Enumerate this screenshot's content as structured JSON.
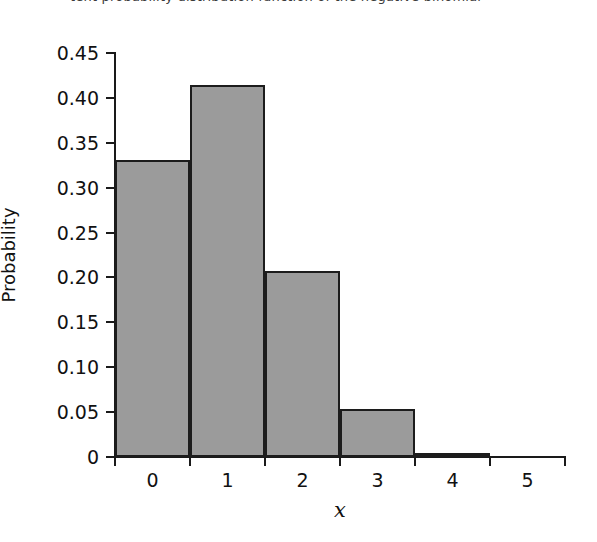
{
  "caption": {
    "text": "tent probability distribution function of the negative binomial"
  },
  "chart_data": {
    "type": "bar",
    "title": "",
    "subtitle": "",
    "xlabel": "x",
    "ylabel": "Probability",
    "categories": [
      "0",
      "1",
      "2",
      "3",
      "4",
      "5"
    ],
    "values": [
      0.331,
      0.414,
      0.207,
      0.053,
      0.005,
      0.0
    ],
    "ylim": [
      0,
      0.45
    ],
    "xlim": [
      0,
      6
    ],
    "ytick_labels": [
      "0.45",
      "0.40",
      "0.35",
      "0.30",
      "0.25",
      "0.20",
      "0.15",
      "0.10",
      "0.05",
      "0"
    ],
    "ytick_values": [
      0.45,
      0.4,
      0.35,
      0.3,
      0.25,
      0.2,
      0.15,
      0.1,
      0.05,
      0
    ],
    "xtick_labels": [
      "0",
      "1",
      "2",
      "3",
      "4",
      "5"
    ],
    "grid": false,
    "legend": null,
    "bar_fill_color": "#9b9b9b",
    "bar_edge_color": "#1c1c1c",
    "axis_color": "#1a1a1a",
    "background_color": "#ffffff"
  }
}
